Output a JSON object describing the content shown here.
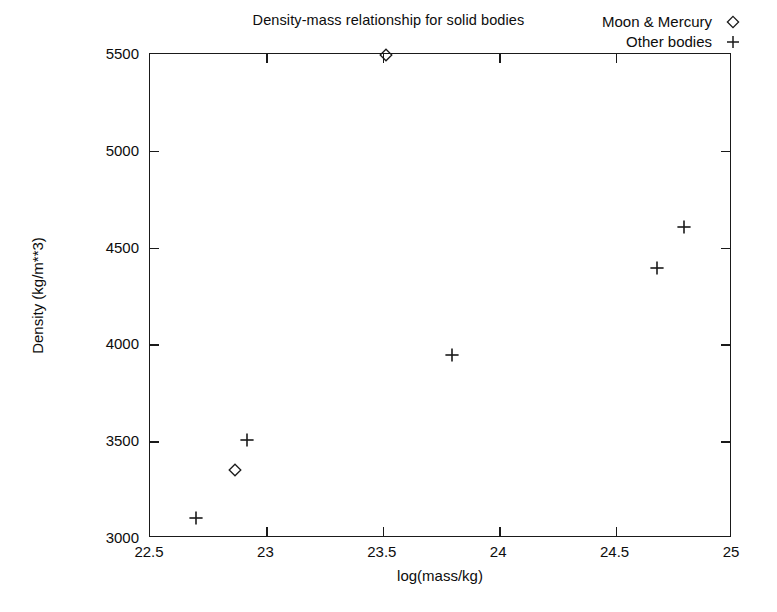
{
  "chart_data": {
    "type": "scatter",
    "title": "Density-mass relationship for solid bodies",
    "xlabel": "log(mass/kg)",
    "ylabel": "Density (kg/m**3)",
    "xlim": [
      22.5,
      25
    ],
    "ylim": [
      3000,
      5500
    ],
    "xticks": [
      "22.5",
      "23",
      "23.5",
      "24",
      "24.5",
      "25"
    ],
    "xtick_values": [
      22.5,
      23,
      23.5,
      24,
      24.5,
      25
    ],
    "yticks": [
      "3000",
      "3500",
      "4000",
      "4500",
      "5000",
      "5500"
    ],
    "ytick_values": [
      3000,
      3500,
      4000,
      4500,
      5000,
      5500
    ],
    "grid": false,
    "legend_position": "top-right",
    "series": [
      {
        "name": "Moon & Mercury",
        "marker": "diamond",
        "points": [
          {
            "x": 22.87,
            "y": 3345
          },
          {
            "x": 23.52,
            "y": 5490
          }
        ]
      },
      {
        "name": "Other bodies",
        "marker": "plus",
        "points": [
          {
            "x": 22.7,
            "y": 3100
          },
          {
            "x": 22.92,
            "y": 3500
          },
          {
            "x": 23.8,
            "y": 3940
          },
          {
            "x": 24.68,
            "y": 4390
          },
          {
            "x": 24.8,
            "y": 4600
          }
        ]
      }
    ]
  },
  "legend": {
    "entries": [
      {
        "label": "Moon & Mercury",
        "marker": "diamond"
      },
      {
        "label": "Other bodies",
        "marker": "plus"
      }
    ]
  },
  "colors": {
    "foreground": "#0d0d0d",
    "axis": "#1a1a1a",
    "background": "#ffffff"
  }
}
